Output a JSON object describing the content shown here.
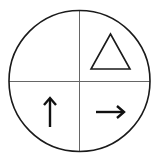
{
  "diagram": {
    "colors": {
      "stroke": "#1a1a1a",
      "divider": "#555555",
      "background": "#ffffff"
    },
    "quadrants": [
      {
        "position": "top-left",
        "symbol": "empty"
      },
      {
        "position": "top-right",
        "symbol": "triangle-outline"
      },
      {
        "position": "bottom-left",
        "symbol": "arrow-up"
      },
      {
        "position": "bottom-right",
        "symbol": "arrow-right"
      }
    ]
  }
}
